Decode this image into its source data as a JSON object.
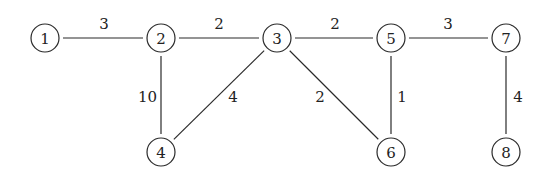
{
  "graph": {
    "type": "undirected-weighted",
    "nodes": [
      {
        "id": "1",
        "label": "1",
        "x": 45,
        "y": 38
      },
      {
        "id": "2",
        "label": "2",
        "x": 161,
        "y": 38
      },
      {
        "id": "3",
        "label": "3",
        "x": 277,
        "y": 38
      },
      {
        "id": "5",
        "label": "5",
        "x": 391,
        "y": 38
      },
      {
        "id": "7",
        "label": "7",
        "x": 506,
        "y": 38
      },
      {
        "id": "4",
        "label": "4",
        "x": 161,
        "y": 152
      },
      {
        "id": "6",
        "label": "6",
        "x": 391,
        "y": 152
      },
      {
        "id": "8",
        "label": "8",
        "x": 506,
        "y": 152
      }
    ],
    "edges": [
      {
        "from": "1",
        "to": "2",
        "weight": "3",
        "lx": 104,
        "ly": 24,
        "anchor": "middle"
      },
      {
        "from": "2",
        "to": "3",
        "weight": "2",
        "lx": 219,
        "ly": 24,
        "anchor": "middle"
      },
      {
        "from": "3",
        "to": "5",
        "weight": "2",
        "lx": 335,
        "ly": 24,
        "anchor": "middle"
      },
      {
        "from": "5",
        "to": "7",
        "weight": "3",
        "lx": 448,
        "ly": 24,
        "anchor": "middle"
      },
      {
        "from": "2",
        "to": "4",
        "weight": "10",
        "lx": 157,
        "ly": 97,
        "anchor": "end"
      },
      {
        "from": "3",
        "to": "4",
        "weight": "4",
        "lx": 233,
        "ly": 97,
        "anchor": "middle"
      },
      {
        "from": "3",
        "to": "6",
        "weight": "2",
        "lx": 320,
        "ly": 97,
        "anchor": "middle"
      },
      {
        "from": "5",
        "to": "6",
        "weight": "1",
        "lx": 402,
        "ly": 97,
        "anchor": "middle"
      },
      {
        "from": "7",
        "to": "8",
        "weight": "4",
        "lx": 518,
        "ly": 97,
        "anchor": "middle"
      }
    ],
    "node_radius": 14
  }
}
